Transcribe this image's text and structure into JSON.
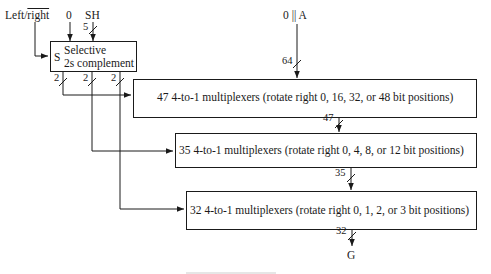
{
  "inputs": {
    "direction": {
      "prefix": "Left/",
      "overlined": "right"
    },
    "zero": "0",
    "shift_amount": "SH",
    "shift_width": "5",
    "operand": "0 || A",
    "operand_width": "64"
  },
  "selective_block": {
    "select_label": "S",
    "line1": "Selective",
    "line2": "2s complement",
    "output_widths": [
      "2",
      "2",
      "2"
    ]
  },
  "stages": [
    {
      "count": "47",
      "text": "4-to-1 multiplexers (rotate right 0, 16, 32, or 48 bit positions)",
      "output_width": "47"
    },
    {
      "count": "35",
      "text": "4-to-1 multiplexers (rotate right 0, 4, 8, or 12 bit positions)",
      "output_width": "35"
    },
    {
      "count": "32",
      "text": "4-to-1 multiplexers (rotate right 0, 1, 2, or 3 bit positions)",
      "output_width": "32"
    }
  ],
  "output": {
    "label": "G"
  },
  "colors": {
    "line": "#1a1a1a",
    "background": "#ffffff"
  }
}
